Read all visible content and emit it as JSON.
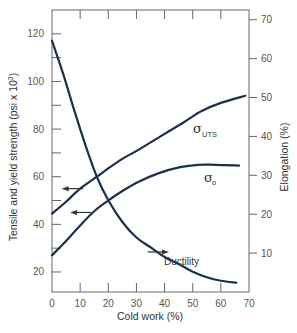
{
  "chart_data": {
    "type": "line",
    "title": "",
    "xlabel": "Cold work (%)",
    "ylabel": "Tensile and yield strength (psi x 10³)",
    "ylabel_text": "Tensile and yield strength (psi x 10",
    "ylabel_sup": "3",
    "ylabel_close": ")",
    "y2label": "Elongation (%)",
    "xlim": [
      0,
      70
    ],
    "ylim": [
      11.6,
      130
    ],
    "y2lim": [
      0,
      72.5
    ],
    "xticks": [
      0,
      10,
      20,
      30,
      40,
      50,
      60,
      70
    ],
    "yticks": [
      20,
      40,
      60,
      80,
      100,
      120
    ],
    "yminor_ticks": [
      30,
      50,
      70,
      90,
      110
    ],
    "y2ticks": [
      10,
      20,
      30,
      40,
      50,
      60,
      70
    ],
    "top_ticks": [
      10,
      20,
      30,
      40,
      50,
      60
    ],
    "grid": false,
    "series": [
      {
        "name": "σUTS",
        "label_main": "σ",
        "label_sub": "UTS",
        "axis": "left",
        "x": [
          0,
          5,
          10,
          16,
          20,
          25,
          31,
          40,
          47,
          53,
          60,
          68.7
        ],
        "y": [
          44.5,
          49.5,
          55,
          60,
          63.5,
          67.5,
          71.5,
          78,
          83,
          87.5,
          91,
          94
        ]
      },
      {
        "name": "σo",
        "label_main": "σ",
        "label_sub": "o",
        "axis": "left",
        "x": [
          0,
          5,
          10,
          15,
          20,
          25,
          31,
          38,
          45.5,
          52,
          58,
          66.5
        ],
        "y": [
          27,
          33,
          39.5,
          45.5,
          50,
          54,
          58,
          61.5,
          64,
          65,
          65,
          64.7
        ]
      },
      {
        "name": "Ductility",
        "label_main": "Ductility",
        "axis": "right",
        "x": [
          0,
          4,
          8,
          12,
          16,
          20,
          25,
          30,
          35,
          40,
          45,
          50,
          55,
          60,
          65.5
        ],
        "y": [
          64.6,
          56,
          46.5,
          37.5,
          29.5,
          23.6,
          18,
          14,
          11.5,
          9,
          7.2,
          5.2,
          3.8,
          2.9,
          2.4
        ]
      }
    ],
    "arrows": [
      {
        "series": "σUTS",
        "direction": "left",
        "x_from": 11,
        "x_to": 4.5,
        "y": 55,
        "axis": "left"
      },
      {
        "series": "σo",
        "direction": "left",
        "x_from": 14,
        "x_to": 7.5,
        "y": 45,
        "axis": "left"
      },
      {
        "series": "Ductility",
        "direction": "right",
        "x_from": 34,
        "x_to": 40.5,
        "y": 10.3,
        "axis": "right"
      }
    ],
    "line_color": "#1c2f4f"
  }
}
